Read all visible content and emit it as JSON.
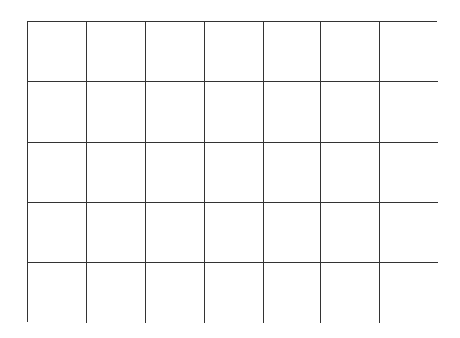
{
  "grid": {
    "columns": 7,
    "rows": 5,
    "line_color": "#333333",
    "background": "#ffffff",
    "cells": [
      [
        "",
        "",
        "",
        "",
        "",
        "",
        ""
      ],
      [
        "",
        "",
        "",
        "",
        "",
        "",
        ""
      ],
      [
        "",
        "",
        "",
        "",
        "",
        "",
        ""
      ],
      [
        "",
        "",
        "",
        "",
        "",
        "",
        ""
      ],
      [
        "",
        "",
        "",
        "",
        "",
        "",
        ""
      ]
    ]
  }
}
